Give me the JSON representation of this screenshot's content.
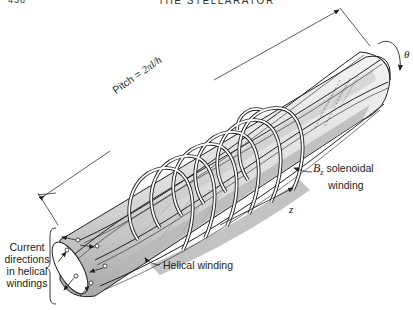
{
  "page": {
    "number": "438",
    "running_title": "THE STELLARATOR"
  },
  "figure": {
    "labels": {
      "pitch_prefix": "Pitch = ",
      "pitch_formula": "2πl/h",
      "theta": "θ",
      "solenoid_symbol": "B",
      "solenoid_subscript": "z",
      "solenoid_line1": " solenoidal",
      "solenoid_line2": "winding",
      "z_axis": "z",
      "helical_winding": "Helical winding",
      "current_directions": [
        "Current",
        "directions",
        "in helical",
        "windings"
      ]
    },
    "colors": {
      "ink": "#222222",
      "shade": "#b8b8b8",
      "light_shade": "#e4e4e4",
      "paper": "#ffffff"
    },
    "components": [
      "helical-winding-cylinder",
      "solenoidal-winding-coils",
      "pitch-dimension-arrow",
      "theta-rotation-arrow",
      "z-axis-arrow",
      "current-direction-arrows"
    ]
  }
}
